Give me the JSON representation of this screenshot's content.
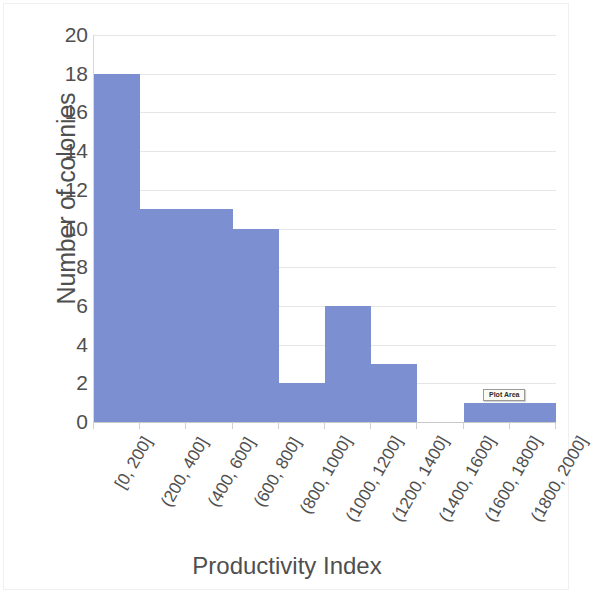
{
  "chart_data": {
    "type": "bar",
    "title": "",
    "subtitle": "",
    "xlabel": "Productivity Index",
    "ylabel": "Number of colonies",
    "categories": [
      "[0, 200]",
      "(200, 400]",
      "(400, 600]",
      "(600, 800]",
      "(800, 1000]",
      "(1000, 1200]",
      "(1200, 1400]",
      "(1400, 1600]",
      "(1600, 1800]",
      "(1800, 2000]"
    ],
    "values": [
      18,
      11,
      11,
      10,
      2,
      6,
      3,
      0,
      1,
      1
    ],
    "ylim": [
      0,
      20
    ],
    "ytick_step": 2,
    "ytick_labels": [
      "0",
      "2",
      "4",
      "6",
      "8",
      "10",
      "12",
      "14",
      "16",
      "18",
      "20"
    ],
    "grid": true,
    "grid_axis": "y",
    "legend": false,
    "legend_position": "none",
    "bar_gap": 0,
    "series": [
      {
        "name": "Number of colonies",
        "values": [
          18,
          11,
          11,
          10,
          2,
          6,
          3,
          0,
          1,
          1
        ]
      }
    ]
  },
  "colors": {
    "bar_fill": "#7c8fd0",
    "gridline": "#e6e6e6",
    "axis_line": "#c8c8c8",
    "text": "#4f4f4f",
    "tooltip_background": "#fbfbf3",
    "tooltip_border": "#9a9a9a",
    "page_background": "#ffffff"
  },
  "annotations": {
    "plot_area_tooltip": "Plot Area"
  }
}
